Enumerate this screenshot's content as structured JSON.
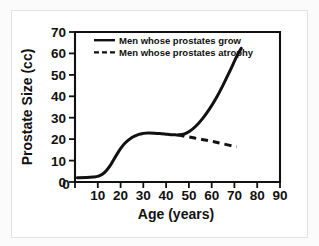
{
  "figure": {
    "background_color": "#ffffff",
    "frame_color": "#e2e2e2",
    "line_color": "#111111"
  },
  "chart_data": {
    "type": "line",
    "title": "",
    "xlabel": "Age (years)",
    "ylabel": "Prostate Size (cc)",
    "xlim": [
      0,
      90
    ],
    "ylim": [
      0,
      70
    ],
    "xticks": [
      0,
      10,
      20,
      30,
      40,
      50,
      60,
      70,
      80,
      90
    ],
    "xtick_labels": [
      "0",
      "10",
      "20",
      "30",
      "40",
      "50",
      "60",
      "70",
      "80",
      "90"
    ],
    "yticks": [
      0,
      10,
      20,
      30,
      40,
      50,
      60,
      70
    ],
    "ytick_labels": [
      "0",
      "10",
      "20",
      "30",
      "40",
      "50",
      "60",
      "70"
    ],
    "grid": false,
    "legend_position": "top-center",
    "series": [
      {
        "name": "Men whose prostates grow",
        "style": "solid",
        "color": "#111111",
        "x": [
          1,
          5,
          8,
          10,
          12,
          14,
          16,
          18,
          20,
          22,
          25,
          28,
          30,
          32,
          35,
          38,
          40,
          42,
          44,
          46,
          48,
          50,
          53,
          56,
          59,
          62,
          65,
          68,
          71,
          73
        ],
        "y": [
          2.0,
          2.1,
          2.3,
          2.6,
          3.6,
          5.6,
          8.6,
          12.2,
          15.6,
          18.2,
          20.8,
          22.2,
          22.7,
          22.9,
          22.8,
          22.5,
          22.3,
          22.1,
          22.0,
          22.0,
          22.4,
          23.4,
          26.0,
          29.6,
          34.0,
          39.2,
          45.2,
          51.8,
          58.6,
          62.4
        ]
      },
      {
        "name": "Men whose prostates atrophy",
        "style": "dashed",
        "color": "#111111",
        "x": [
          45,
          50,
          55,
          60,
          65,
          71
        ],
        "y": [
          22.0,
          21.0,
          20.0,
          19.0,
          17.8,
          16.4
        ]
      }
    ],
    "legend": [
      {
        "label": "Men whose prostates grow",
        "style": "solid"
      },
      {
        "label": "Men whose prostates atrophy",
        "style": "dashed"
      }
    ]
  }
}
